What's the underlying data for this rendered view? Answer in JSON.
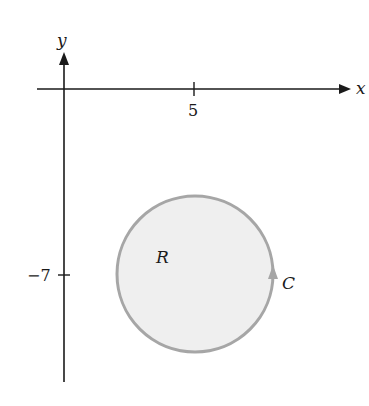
{
  "figure": {
    "axes": {
      "x_label": "x",
      "y_label": "y",
      "x_tick": "5",
      "y_tick": "−7"
    },
    "region_label": "R",
    "curve_label": "C",
    "colors": {
      "axis": "#1a1a1a",
      "circle_stroke": "#a6a6a6",
      "circle_fill": "#efefef",
      "background": "#ffffff"
    },
    "circle": {
      "center_x": 5,
      "center_y": -7,
      "orientation": "counterclockwise"
    }
  }
}
